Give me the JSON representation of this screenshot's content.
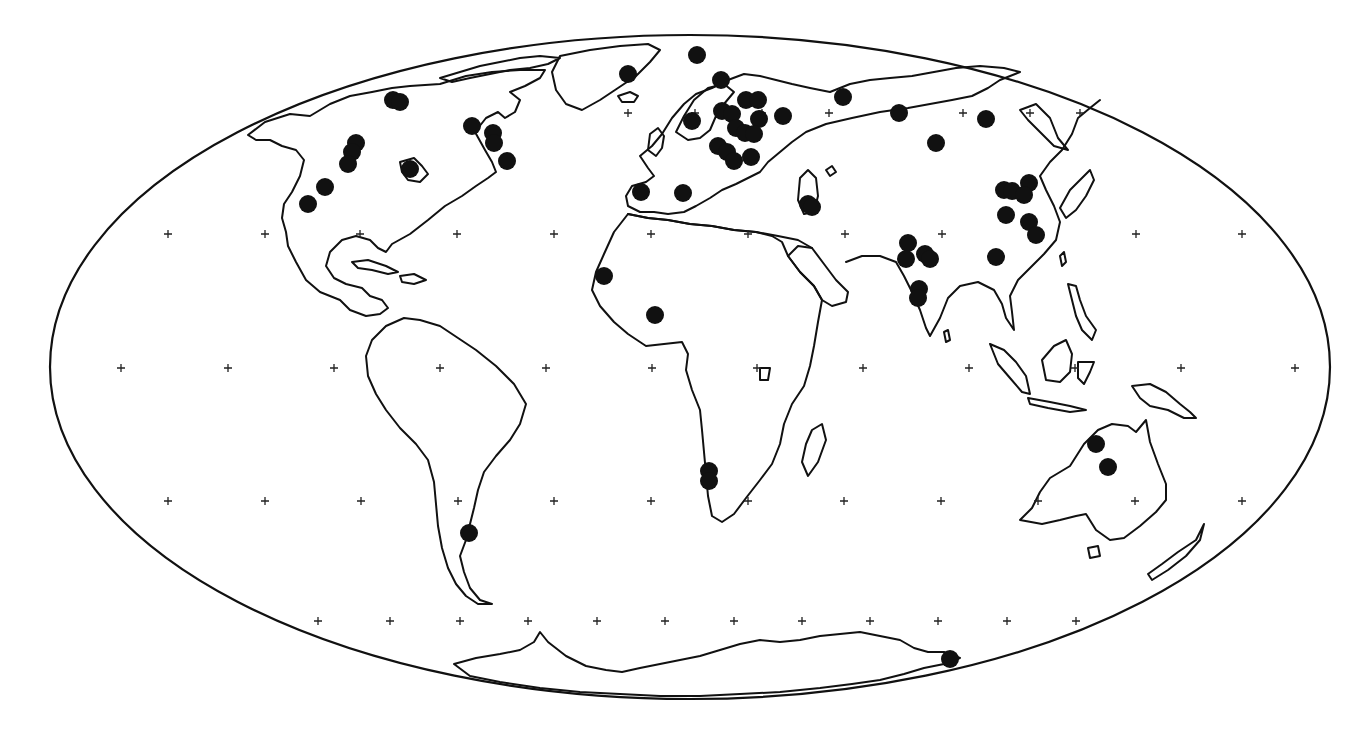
{
  "map": {
    "projection": "mollweide",
    "colors": {
      "background": "#ffffff",
      "outline": "#111111",
      "marker": "#111111",
      "graticule": "#222222"
    },
    "ellipse": {
      "cx": 690,
      "cy": 367,
      "rx": 640,
      "ry": 332
    },
    "graticule_rows": [
      {
        "lat": 60,
        "y": 113,
        "xs": [
          628,
          695,
          762,
          829,
          896,
          963,
          1030,
          1080
        ]
      },
      {
        "lat": 30,
        "y": 234,
        "xs": [
          168,
          265,
          360,
          457,
          554,
          651,
          748,
          845,
          942,
          1039,
          1136,
          1242
        ]
      },
      {
        "lat": 0,
        "y": 368,
        "xs": [
          121,
          228,
          334,
          440,
          546,
          652,
          757,
          863,
          969,
          1075,
          1181,
          1295
        ]
      },
      {
        "lat": -30,
        "y": 501,
        "xs": [
          168,
          265,
          361,
          458,
          554,
          651,
          748,
          844,
          941,
          1038,
          1135,
          1242
        ]
      },
      {
        "lat": -60,
        "y": 621,
        "xs": [
          318,
          390,
          460,
          528,
          597,
          665,
          734,
          802,
          870,
          938,
          1007,
          1076
        ]
      }
    ],
    "markers": [
      {
        "region": "Alaska/Yukon",
        "x": 393,
        "y": 100
      },
      {
        "region": "Alaska/Yukon",
        "x": 400,
        "y": 102
      },
      {
        "region": "Western Canada",
        "x": 356,
        "y": 143
      },
      {
        "region": "Western Canada",
        "x": 352,
        "y": 152
      },
      {
        "region": "Western Canada",
        "x": 348,
        "y": 164
      },
      {
        "region": "Western USA",
        "x": 325,
        "y": 187
      },
      {
        "region": "Western USA",
        "x": 308,
        "y": 204
      },
      {
        "region": "Hudson Bay",
        "x": 410,
        "y": 169
      },
      {
        "region": "Baffin/Quebec",
        "x": 472,
        "y": 126
      },
      {
        "region": "Quebec",
        "x": 493,
        "y": 133
      },
      {
        "region": "Quebec",
        "x": 494,
        "y": 143
      },
      {
        "region": "Labrador",
        "x": 507,
        "y": 161
      },
      {
        "region": "Greenland",
        "x": 628,
        "y": 74
      },
      {
        "region": "Svalbard",
        "x": 697,
        "y": 55
      },
      {
        "region": "Scandinavia",
        "x": 721,
        "y": 80
      },
      {
        "region": "Norway",
        "x": 692,
        "y": 121
      },
      {
        "region": "Finland/Russia",
        "x": 746,
        "y": 100
      },
      {
        "region": "Finland/Russia",
        "x": 758,
        "y": 100
      },
      {
        "region": "Baltic",
        "x": 722,
        "y": 111
      },
      {
        "region": "Baltic",
        "x": 732,
        "y": 114
      },
      {
        "region": "Russia",
        "x": 759,
        "y": 119
      },
      {
        "region": "Russia",
        "x": 783,
        "y": 116
      },
      {
        "region": "Eastern Europe",
        "x": 736,
        "y": 128
      },
      {
        "region": "Eastern Europe",
        "x": 745,
        "y": 133
      },
      {
        "region": "Eastern Europe",
        "x": 754,
        "y": 134
      },
      {
        "region": "Central Europe",
        "x": 718,
        "y": 146
      },
      {
        "region": "Central Europe",
        "x": 727,
        "y": 152
      },
      {
        "region": "Balkans",
        "x": 734,
        "y": 161
      },
      {
        "region": "Black Sea",
        "x": 751,
        "y": 157
      },
      {
        "region": "Iberia",
        "x": 641,
        "y": 192
      },
      {
        "region": "Italy",
        "x": 683,
        "y": 193
      },
      {
        "region": "Caspian",
        "x": 808,
        "y": 204
      },
      {
        "region": "Caspian",
        "x": 812,
        "y": 207
      },
      {
        "region": "Western Siberia",
        "x": 843,
        "y": 97
      },
      {
        "region": "Central Siberia",
        "x": 899,
        "y": 113
      },
      {
        "region": "Kazakhstan",
        "x": 936,
        "y": 143
      },
      {
        "region": "Eastern Siberia",
        "x": 986,
        "y": 119
      },
      {
        "region": "Northeast China",
        "x": 1004,
        "y": 190
      },
      {
        "region": "Northeast China",
        "x": 1012,
        "y": 191
      },
      {
        "region": "Korea",
        "x": 1029,
        "y": 183
      },
      {
        "region": "Korea",
        "x": 1024,
        "y": 195
      },
      {
        "region": "North China",
        "x": 1006,
        "y": 215
      },
      {
        "region": "East China",
        "x": 1029,
        "y": 222
      },
      {
        "region": "East China",
        "x": 1036,
        "y": 235
      },
      {
        "region": "South China",
        "x": 996,
        "y": 257
      },
      {
        "region": "Pakistan/India",
        "x": 908,
        "y": 243
      },
      {
        "region": "Pakistan/India",
        "x": 906,
        "y": 259
      },
      {
        "region": "North India",
        "x": 925,
        "y": 254
      },
      {
        "region": "North India",
        "x": 930,
        "y": 259
      },
      {
        "region": "Western India",
        "x": 919,
        "y": 289
      },
      {
        "region": "Western India",
        "x": 918,
        "y": 298
      },
      {
        "region": "West Africa coast",
        "x": 604,
        "y": 276
      },
      {
        "region": "West Africa interior",
        "x": 655,
        "y": 315
      },
      {
        "region": "Namibia",
        "x": 709,
        "y": 471
      },
      {
        "region": "Namibia",
        "x": 709,
        "y": 481
      },
      {
        "region": "Patagonia",
        "x": 469,
        "y": 533
      },
      {
        "region": "Northern Australia",
        "x": 1096,
        "y": 444
      },
      {
        "region": "Central Australia",
        "x": 1108,
        "y": 467
      },
      {
        "region": "Antarctica",
        "x": 950,
        "y": 659
      }
    ]
  }
}
